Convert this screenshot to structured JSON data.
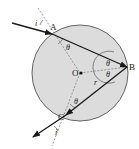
{
  "diagram": {
    "type": "ray-optics-droplet",
    "colors": {
      "circle_fill": "#dcdcdc",
      "circle_stroke": "#555555",
      "ray": "#1a1a1a",
      "dashed": "#777777",
      "text": "#222222"
    },
    "labels": {
      "point_a": "A",
      "point_b": "B",
      "point_c": "C",
      "center": "O",
      "radius": "r",
      "angle_theta": "θ",
      "angle_incident_top": "i",
      "angle_incident_bottom": "i"
    },
    "geometry": {
      "center": [
        80,
        73
      ],
      "radius": 48,
      "A": [
        52,
        34
      ],
      "B": [
        127,
        67
      ],
      "C": [
        66,
        115
      ]
    }
  }
}
